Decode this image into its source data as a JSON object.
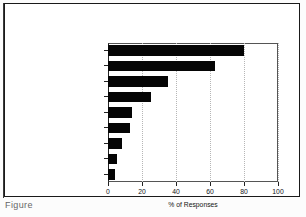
{
  "figure": {
    "caption_fragment": "Figure",
    "background": "#ffffff",
    "frame_color": "#1a1a1a",
    "bar_color": "#050505"
  },
  "chart_data": {
    "type": "bar",
    "orientation": "horizontal",
    "title": "",
    "xlabel": "% of Responses",
    "ylabel": "",
    "xlim": [
      0,
      100
    ],
    "xticks": [
      0,
      20,
      40,
      60,
      80,
      100
    ],
    "grid": "vertical-dotted",
    "legend": "none",
    "categories": [
      "Past Sales",
      "Mkt Res./Comp. Sit.",
      "Industry Stats.",
      "Trends/Proj. Tech.",
      "Econ./Polit. Situat.",
      "Order Backlog",
      "Consensus",
      "Causal Model",
      "Economic Indicies"
    ],
    "values": [
      80,
      63,
      35,
      25,
      14,
      13,
      8,
      5,
      4
    ]
  }
}
